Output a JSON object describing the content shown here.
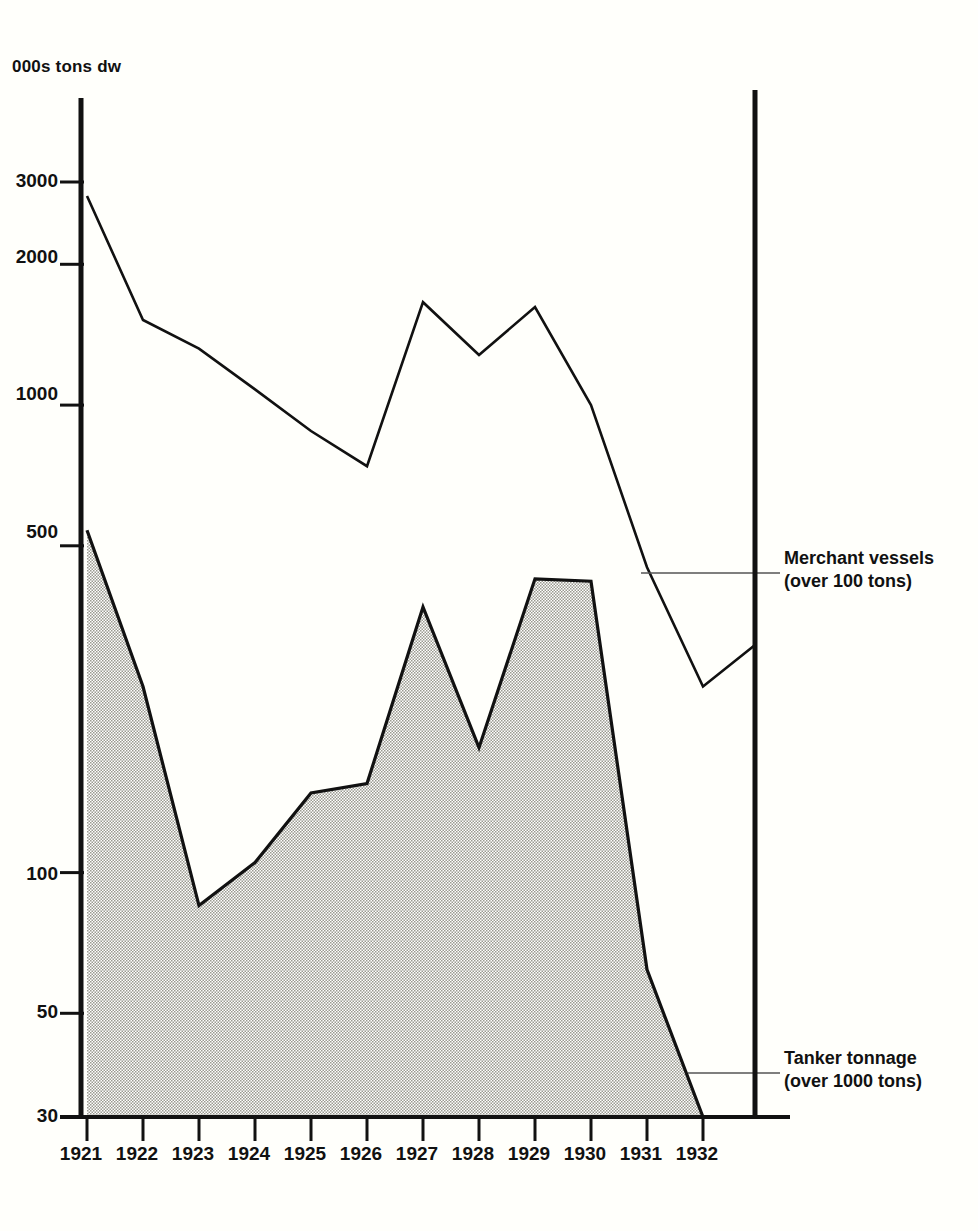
{
  "chart_data": {
    "type": "area",
    "title": "",
    "ylabel": "000s tons dw",
    "xlabel": "",
    "yscale": "log",
    "ylim": [
      30,
      4000
    ],
    "grid": false,
    "legend_position": "right-inline-annotations",
    "categories": [
      "1921",
      "1922",
      "1923",
      "1924",
      "1925",
      "1926",
      "1927",
      "1928",
      "1929",
      "1930",
      "1931",
      "1932"
    ],
    "series": [
      {
        "name": "Merchant vessels (over 100 tons)",
        "style": "line",
        "values": [
          2800,
          1520,
          1320,
          1080,
          880,
          740,
          1660,
          1280,
          1620,
          1000,
          450,
          250
        ]
      },
      {
        "name": "Tanker tonnage (over 1000 tons)",
        "style": "filled-area",
        "values": [
          540,
          250,
          85,
          105,
          148,
          155,
          370,
          185,
          425,
          420,
          62,
          30
        ]
      }
    ],
    "yticks": [
      {
        "value": 3000,
        "label": "3000"
      },
      {
        "value": 2000,
        "label": "2000"
      },
      {
        "value": 1000,
        "label": "1000"
      },
      {
        "value": 500,
        "label": "500"
      },
      {
        "value": 100,
        "label": "100"
      },
      {
        "value": 50,
        "label": "50"
      },
      {
        "value": 30,
        "label": "30"
      }
    ],
    "annotations": [
      {
        "id": "merchant",
        "line1": "Merchant vessels",
        "line2": "(over 100 tons)"
      },
      {
        "id": "tanker",
        "line1": "Tanker tonnage",
        "line2": "(over 1000 tons)"
      }
    ],
    "colors": {
      "line": "#111111",
      "area_fill": "#d8d8d0",
      "axis": "#111111",
      "background": "#fffffb"
    }
  }
}
